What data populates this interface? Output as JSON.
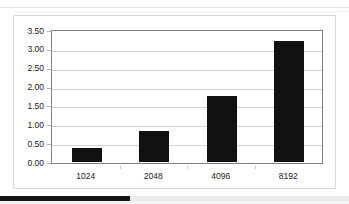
{
  "chart_data": {
    "type": "bar",
    "title": "",
    "xlabel": "",
    "ylabel": "",
    "categories": [
      "1024",
      "2048",
      "4096",
      "8192"
    ],
    "values": [
      0.38,
      0.83,
      1.74,
      3.21
    ],
    "ylim": [
      0.0,
      3.5
    ],
    "ytick_labels": [
      "0.00",
      "0.50",
      "1.00",
      "1.50",
      "2.00",
      "2.50",
      "3.00",
      "3.50"
    ],
    "ytick_values": [
      0.0,
      0.5,
      1.0,
      1.5,
      2.0,
      2.5,
      3.0,
      3.5
    ],
    "grid": true,
    "legend": "none",
    "bar_color": "#111111",
    "gridline_color": "#d0d0d0",
    "plot_border_color": "#808080",
    "background_color": "#ffffff",
    "series": [
      {
        "name": "series-1",
        "values": [
          0.38,
          0.83,
          1.74,
          3.21
        ]
      }
    ]
  },
  "figure": {
    "card_border_color": "#d9d9d9"
  },
  "bottom_strip": {
    "dark_color": "#141414",
    "light_color": "#e9eaec"
  }
}
